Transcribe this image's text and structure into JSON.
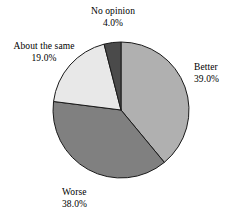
{
  "chart_data": {
    "type": "pie",
    "title": "",
    "subtitle": "",
    "xlabel": "",
    "ylabel": "",
    "legend": "none",
    "grid": false,
    "value_format": "percent_one_decimal",
    "start_angle_deg": 0,
    "direction": "clockwise",
    "categories": [
      "Better",
      "Worse",
      "About the same",
      "No opinion"
    ],
    "values": [
      39.0,
      38.0,
      19.0,
      4.0
    ],
    "slices": [
      {
        "label": "Better",
        "value": 39.0,
        "value_text": "39.0%",
        "color": "#b0b0b0",
        "start_deg": 0.0,
        "end_deg": 140.4,
        "label_position": "right"
      },
      {
        "label": "Worse",
        "value": 38.0,
        "value_text": "38.0%",
        "color": "#808080",
        "start_deg": 140.4,
        "end_deg": 277.2,
        "label_position": "bottom"
      },
      {
        "label": "About the same",
        "value": 19.0,
        "value_text": "19.0%",
        "color": "#e8e8e8",
        "start_deg": 277.2,
        "end_deg": 345.6,
        "label_position": "upper-left"
      },
      {
        "label": "No opinion",
        "value": 4.0,
        "value_text": "4.0%",
        "color": "#4a4a4a",
        "start_deg": 345.6,
        "end_deg": 360.0,
        "label_position": "top"
      }
    ],
    "geometry": {
      "center_x": 121,
      "center_y": 110,
      "radius": 68,
      "outline_color": "#1a1a1a"
    },
    "background_color": "#ffffff"
  }
}
